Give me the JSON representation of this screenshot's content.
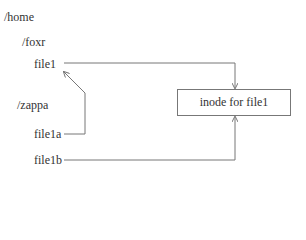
{
  "diagram": {
    "directories": {
      "home": "/home",
      "foxr": "/foxr",
      "zappa": "/zappa"
    },
    "files": {
      "file1": "file1",
      "file1a": "file1a",
      "file1b": "file1b"
    },
    "inode_label": "inode for file1",
    "links": [
      {
        "from": "file1",
        "to": "inode for file1",
        "type": "arrow"
      },
      {
        "from": "file1a",
        "to": "file1",
        "type": "arrow"
      },
      {
        "from": "file1b",
        "to": "inode for file1",
        "type": "arrow"
      }
    ],
    "line_color": "#777777"
  }
}
